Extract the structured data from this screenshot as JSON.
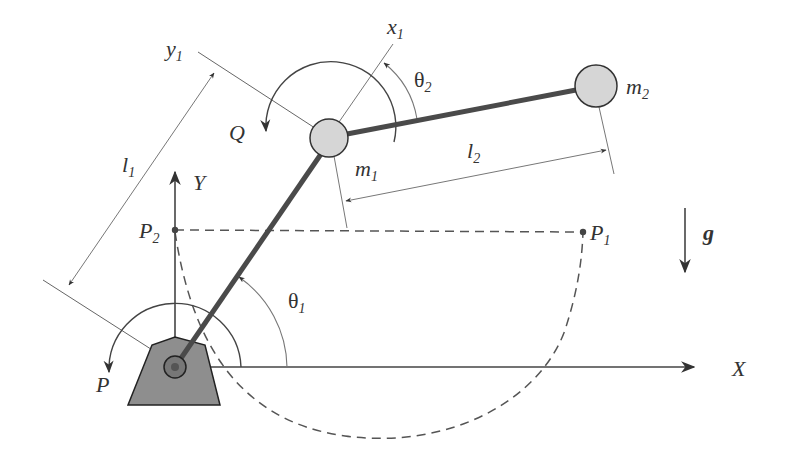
{
  "diagram": {
    "labels": {
      "x_axis": "X",
      "y_axis": "Y",
      "x1_axis": "x",
      "x1_sub": "1",
      "y1_axis": "y",
      "y1_sub": "1",
      "link1_length": "l",
      "link1_sub": "1",
      "link2_length": "l",
      "link2_sub": "2",
      "mass1": "m",
      "mass1_sub": "1",
      "mass2": "m",
      "mass2_sub": "2",
      "theta1": "θ",
      "theta1_sub": "1",
      "theta2": "θ",
      "theta2_sub": "2",
      "torque_base": "P",
      "torque_joint": "Q",
      "point1": "P",
      "point1_sub": "1",
      "point2": "P",
      "point2_sub": "2",
      "gravity": "g"
    },
    "colors": {
      "link": "#4a4a4a",
      "mass_fill": "#d6d6d6",
      "base_fill": "#8e8e8e",
      "line": "#555555",
      "thin_line": "#777777"
    }
  }
}
